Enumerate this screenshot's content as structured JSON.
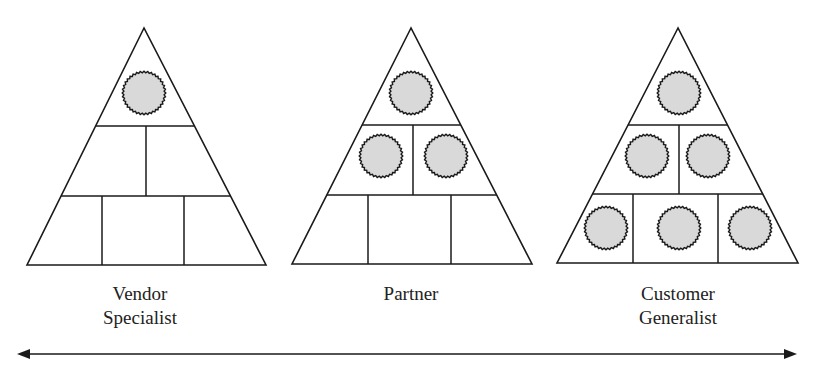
{
  "diagram": {
    "colors": {
      "stroke": "#1a1a1a",
      "circle_fill": "#d9d9d9",
      "background": "#ffffff"
    },
    "pyramids": [
      {
        "name": "vendor",
        "label_lines": [
          "Vendor",
          "Specialist"
        ],
        "apex": [
          144,
          28
        ],
        "base_left": [
          27,
          265
        ],
        "base_right": [
          266,
          265
        ],
        "row_lines_y": [
          126,
          196
        ],
        "row2_dividers_x": [
          146
        ],
        "row3_dividers_x": [
          102,
          184
        ],
        "filled_circles": [
          [
            144,
            93
          ]
        ]
      },
      {
        "name": "partner",
        "label_lines": [
          "Partner"
        ],
        "apex": [
          411,
          28
        ],
        "base_left": [
          292,
          264
        ],
        "base_right": [
          532,
          264
        ],
        "row_lines_y": [
          125,
          195
        ],
        "row2_dividers_x": [
          413
        ],
        "row3_dividers_x": [
          368,
          451
        ],
        "filled_circles": [
          [
            411,
            93
          ],
          [
            381,
            156
          ],
          [
            446,
            156
          ]
        ]
      },
      {
        "name": "customer",
        "label_lines": [
          "Customer",
          "Generalist"
        ],
        "apex": [
          678,
          28
        ],
        "base_left": [
          557,
          263
        ],
        "base_right": [
          798,
          263
        ],
        "row_lines_y": [
          125,
          194
        ],
        "row2_dividers_x": [
          679
        ],
        "row3_dividers_x": [
          633,
          718
        ],
        "filled_circles": [
          [
            679,
            93
          ],
          [
            647,
            156
          ],
          [
            708,
            156
          ],
          [
            606,
            228
          ],
          [
            679,
            228
          ],
          [
            750,
            228
          ]
        ]
      }
    ],
    "labels": {
      "vendor": {
        "line1": "Vendor",
        "line2": "Specialist"
      },
      "partner": {
        "line1": "Partner"
      },
      "customer": {
        "line1": "Customer",
        "line2": "Generalist"
      }
    },
    "arrow": {
      "type": "double-headed",
      "y": 354,
      "x_start": 17,
      "x_end": 797
    },
    "circle": {
      "radius": 21,
      "teeth": 36,
      "tooth_depth": 1.6
    }
  }
}
